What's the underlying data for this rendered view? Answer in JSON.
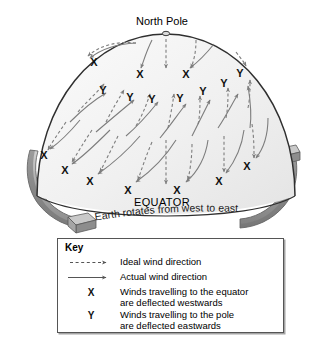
{
  "figure": {
    "title_labels": {
      "north_pole": "North Pole",
      "equator": "EQUATOR",
      "rotation_caption": "Earth rotates from west to east"
    },
    "colors": {
      "dome_fill": "#f1f1f1",
      "dome_outline": "#333333",
      "band_fill": "#9a9a9a",
      "band_outline": "#555555",
      "arrow": "#7d7d7d",
      "marker": "#111111",
      "key_border": "#555555"
    },
    "markers": [
      {
        "label": "X",
        "x": 94,
        "y": 62
      },
      {
        "label": "X",
        "x": 140,
        "y": 74
      },
      {
        "label": "X",
        "x": 186,
        "y": 74
      },
      {
        "label": "Y",
        "x": 240,
        "y": 73
      },
      {
        "label": "Y",
        "x": 224,
        "y": 83
      },
      {
        "label": "Y",
        "x": 203,
        "y": 91
      },
      {
        "label": "Y",
        "x": 180,
        "y": 98
      },
      {
        "label": "Y",
        "x": 152,
        "y": 99
      },
      {
        "label": "Y",
        "x": 130,
        "y": 97
      },
      {
        "label": "Y",
        "x": 103,
        "y": 90
      },
      {
        "label": "X",
        "x": 44,
        "y": 155
      },
      {
        "label": "X",
        "x": 65,
        "y": 170
      },
      {
        "label": "X",
        "x": 90,
        "y": 181
      },
      {
        "label": "X",
        "x": 128,
        "y": 190
      },
      {
        "label": "X",
        "x": 177,
        "y": 190
      },
      {
        "label": "X",
        "x": 219,
        "y": 181
      },
      {
        "label": "X",
        "x": 247,
        "y": 166
      }
    ]
  },
  "key": {
    "title": "Key",
    "rows": [
      {
        "symbol": "dashed-arrow",
        "text": "Ideal wind direction"
      },
      {
        "symbol": "solid-arrow",
        "text": "Actual wind direction"
      },
      {
        "symbol": "X",
        "text": "Winds travelling to the equator\nare deflected westwards"
      },
      {
        "symbol": "Y",
        "text": "Winds travelling to the pole\nare deflected eastwards"
      }
    ]
  },
  "chart_data": {
    "type": "diagram",
    "legend": [
      "Ideal wind direction",
      "Actual wind direction",
      "X = deflected westwards",
      "Y = deflected eastwards"
    ]
  }
}
